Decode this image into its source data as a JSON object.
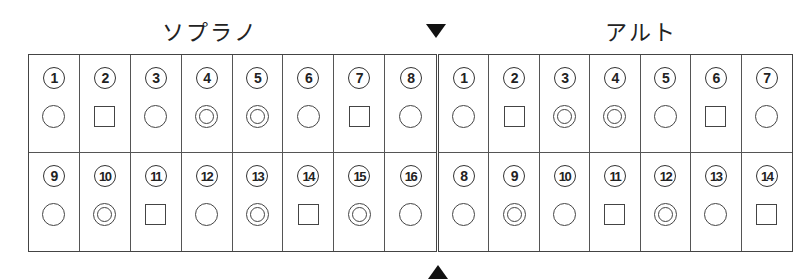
{
  "headings": {
    "soprano": "ソプラノ",
    "alto": "アルト"
  },
  "markers": {
    "top_arrow": "down-triangle",
    "bottom_arrow": "up-triangle"
  },
  "legend_shapes": {
    "circle": "○",
    "double_circle": "◎",
    "square": "□"
  },
  "soprano": {
    "rows": [
      [
        {
          "num": "1",
          "label": "①",
          "mark": "circle"
        },
        {
          "num": "2",
          "label": "②",
          "mark": "square"
        },
        {
          "num": "3",
          "label": "③",
          "mark": "circle"
        },
        {
          "num": "4",
          "label": "④",
          "mark": "double"
        },
        {
          "num": "5",
          "label": "⑤",
          "mark": "double"
        },
        {
          "num": "6",
          "label": "⑥",
          "mark": "circle"
        },
        {
          "num": "7",
          "label": "⑦",
          "mark": "square"
        },
        {
          "num": "8",
          "label": "⑧",
          "mark": "circle"
        }
      ],
      [
        {
          "num": "9",
          "label": "⑨",
          "mark": "circle"
        },
        {
          "num": "10",
          "label": "⑩",
          "mark": "double"
        },
        {
          "num": "11",
          "label": "⑪",
          "mark": "square"
        },
        {
          "num": "12",
          "label": "⑫",
          "mark": "circle"
        },
        {
          "num": "13",
          "label": "⑬",
          "mark": "double"
        },
        {
          "num": "14",
          "label": "⑭",
          "mark": "square"
        },
        {
          "num": "15",
          "label": "⑮",
          "mark": "double"
        },
        {
          "num": "16",
          "label": "⑯",
          "mark": "circle"
        }
      ]
    ]
  },
  "alto": {
    "rows": [
      [
        {
          "num": "1",
          "label": "①",
          "mark": "circle"
        },
        {
          "num": "2",
          "label": "②",
          "mark": "square"
        },
        {
          "num": "3",
          "label": "③",
          "mark": "double"
        },
        {
          "num": "4",
          "label": "④",
          "mark": "double"
        },
        {
          "num": "5",
          "label": "⑤",
          "mark": "circle"
        },
        {
          "num": "6",
          "label": "⑥",
          "mark": "square"
        },
        {
          "num": "7",
          "label": "⑦",
          "mark": "circle"
        }
      ],
      [
        {
          "num": "8",
          "label": "⑧",
          "mark": "circle"
        },
        {
          "num": "9",
          "label": "⑨",
          "mark": "double"
        },
        {
          "num": "10",
          "label": "⑩",
          "mark": "circle"
        },
        {
          "num": "11",
          "label": "⑪",
          "mark": "square"
        },
        {
          "num": "12",
          "label": "⑫",
          "mark": "double"
        },
        {
          "num": "13",
          "label": "⑬",
          "mark": "circle"
        },
        {
          "num": "14",
          "label": "⑭",
          "mark": "square"
        }
      ]
    ]
  }
}
